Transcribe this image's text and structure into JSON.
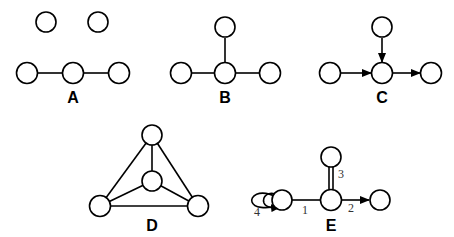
{
  "diagram": {
    "panels": [
      {
        "id": "A",
        "label": "A",
        "description": "Two isolated nodes above a chain of three nodes connected by undirected edges"
      },
      {
        "id": "B",
        "label": "B",
        "description": "Star graph: central node connected to left, right and top nodes"
      },
      {
        "id": "C",
        "label": "C",
        "description": "Directed star: left and top nodes point into center, center points to right node"
      },
      {
        "id": "D",
        "label": "D",
        "description": "Complete graph K4 drawn as triangle with central node"
      },
      {
        "id": "E",
        "label": "E",
        "description": "Multigraph with labeled edges: 1 undirected, 2 directed, 3 double edge, 4 self-loops"
      }
    ],
    "edge_labels": {
      "e1": "1",
      "e2": "2",
      "e3": "3",
      "e4": "4"
    },
    "colors": {
      "stroke": "#000000",
      "fill": "#ffffff",
      "edge_label": "#333333"
    }
  }
}
